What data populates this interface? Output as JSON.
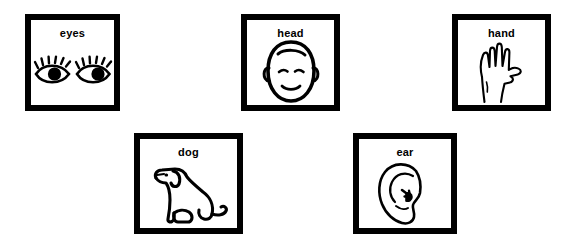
{
  "sheet": {
    "title": "Picture word cards",
    "background_color": "#ffffff",
    "ink_color": "#000000",
    "card_border_color": "#000000"
  },
  "cards": [
    {
      "label": "eyes",
      "icon": "eyes-icon",
      "row": 1,
      "position": 1,
      "x": 25,
      "y": 14,
      "width": 95,
      "height": 97
    },
    {
      "label": "head",
      "icon": "head-icon",
      "row": 1,
      "position": 2,
      "x": 241,
      "y": 14,
      "width": 99,
      "height": 97
    },
    {
      "label": "hand",
      "icon": "hand-icon",
      "row": 1,
      "position": 3,
      "x": 452,
      "y": 14,
      "width": 99,
      "height": 97
    },
    {
      "label": "dog",
      "icon": "dog-icon",
      "row": 2,
      "position": 1,
      "x": 134,
      "y": 133,
      "width": 109,
      "height": 101
    },
    {
      "label": "ear",
      "icon": "ear-icon",
      "row": 2,
      "position": 2,
      "x": 353,
      "y": 133,
      "width": 104,
      "height": 101
    }
  ]
}
